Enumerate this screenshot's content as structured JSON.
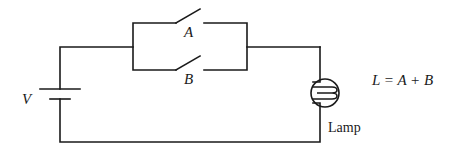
{
  "diagram": {
    "labels": {
      "source": "V",
      "switch_a": "A",
      "switch_b": "B",
      "equation": "L = A + B",
      "lamp": "Lamp"
    },
    "components": [
      {
        "type": "battery",
        "label": "V"
      },
      {
        "type": "switch",
        "label": "A",
        "state": "open"
      },
      {
        "type": "switch",
        "label": "B",
        "state": "open"
      },
      {
        "type": "lamp",
        "label": "Lamp"
      }
    ],
    "colors": {
      "line": "#1a1a1a",
      "background": "#ffffff"
    }
  }
}
